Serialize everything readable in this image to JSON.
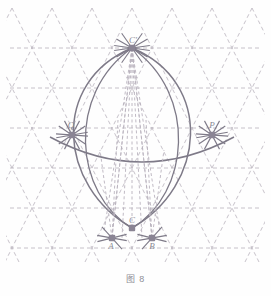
{
  "figure": {
    "caption": "图 8",
    "canvas": {
      "width": 271,
      "height": 296
    },
    "colors": {
      "background": "#fefefe",
      "grid_dashed": "#b9b2bd",
      "solid_curve": "#7e7a88",
      "point_marker": "#8a8494",
      "label_text": "#8a8a94",
      "caption_text": "#8e8e96"
    },
    "lattice": {
      "description": "triangular (isometric) dashed lattice",
      "row_spacing_px": 40,
      "column_spacing_px": 40,
      "rows_y": [
        8,
        48,
        88,
        128,
        168,
        208,
        248,
        288
      ],
      "cols_x": [
        -8,
        12,
        32,
        52,
        72,
        92,
        112,
        132,
        152,
        172,
        192,
        212,
        232,
        252,
        272
      ],
      "horizontal_rows_drawn_y": [
        48,
        88,
        128,
        168,
        208,
        248
      ]
    },
    "points": [
      {
        "id": "C-prime",
        "label": "C'",
        "x": 132,
        "y": 48,
        "label_dx": 1,
        "label_dy": -5
      },
      {
        "id": "Q",
        "label": "Q",
        "x": 72,
        "y": 135,
        "label_dx": -1,
        "label_dy": -7
      },
      {
        "id": "P",
        "label": "P",
        "x": 212,
        "y": 135,
        "label_dx": 0,
        "label_dy": -7
      },
      {
        "id": "C",
        "label": "C",
        "x": 132,
        "y": 228,
        "label_dx": 0,
        "label_dy": -5
      },
      {
        "id": "A",
        "label": "A",
        "x": 112,
        "y": 238,
        "label_dx": -1,
        "label_dy": 11
      },
      {
        "id": "B",
        "label": "B",
        "x": 152,
        "y": 238,
        "label_dx": 0,
        "label_dy": 11
      }
    ],
    "solid_curves": [
      {
        "id": "outer-oval",
        "type": "ellipse-like closed curve through C-prime and C"
      },
      {
        "id": "inner-oval",
        "type": "narrower closed curve through C-prime and C"
      },
      {
        "id": "wide-arc",
        "type": "shallow arc passing through Q and P"
      }
    ],
    "construction_marks": [
      {
        "id": "cross-hairs-C-prime",
        "at": "C-prime",
        "count": 6
      },
      {
        "id": "cross-hairs-Q",
        "at": "Q",
        "count": 6
      },
      {
        "id": "cross-hairs-P",
        "at": "P",
        "count": 6
      },
      {
        "id": "cross-hairs-A",
        "at": "A",
        "count": 4
      },
      {
        "id": "cross-hairs-B",
        "at": "B",
        "count": 4
      }
    ]
  }
}
